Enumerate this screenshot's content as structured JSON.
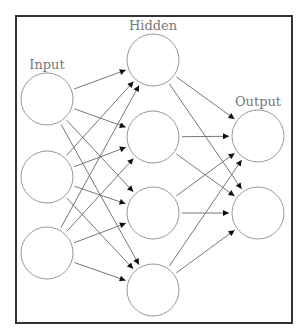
{
  "diagram": {
    "type": "feedforward-neural-network",
    "layers": [
      {
        "name": "input",
        "label": "Input",
        "nodes": 3
      },
      {
        "name": "hidden",
        "label": "Hidden",
        "nodes": 4
      },
      {
        "name": "output",
        "label": "Output",
        "nodes": 2
      }
    ],
    "connections": "fully-connected",
    "colors": {
      "frame": "#333333",
      "node": "#999999",
      "edge": "#777777",
      "arrow": "#111111",
      "label": "#777777"
    }
  }
}
